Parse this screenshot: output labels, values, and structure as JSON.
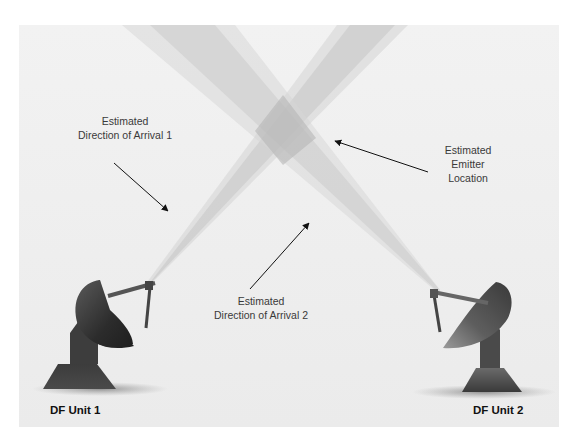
{
  "diagram": {
    "type": "direction-finding triangulation",
    "background_color": "#efefef",
    "beam_color": "#c9c9c9",
    "intersection_color": "#b9b9b9",
    "dish_color_dark": "#2e2e2e",
    "dish_color_light": "#8a8a8a",
    "labels": {
      "doa1": [
        "Estimated",
        "Direction of Arrival 1"
      ],
      "doa2": [
        "Estimated",
        "Direction of Arrival 2"
      ],
      "emitter": [
        "Estimated",
        "Emitter",
        "Location"
      ]
    },
    "units": [
      {
        "id": "unit1",
        "label": "DF Unit 1",
        "icon": "satellite-dish-icon"
      },
      {
        "id": "unit2",
        "label": "DF Unit 2",
        "icon": "satellite-dish-icon"
      }
    ]
  }
}
